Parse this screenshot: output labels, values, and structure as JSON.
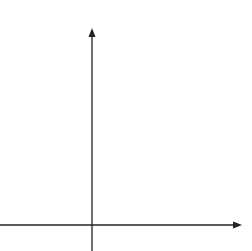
{
  "axes": {
    "x_label": "x",
    "y_label": "y",
    "x_ticks": [
      "−3",
      "−2",
      "−1",
      "0",
      "1",
      "2",
      "3",
      "4",
      "5",
      "6"
    ],
    "y_ticks": [
      "1",
      "2",
      "3",
      "4",
      "5",
      "6",
      "7",
      "8",
      "9"
    ],
    "x_range": [
      -4,
      7
    ],
    "y_range": [
      -1,
      9.7
    ]
  },
  "shape": {
    "label": "A",
    "vertices": [
      [
        4,
        1
      ],
      [
        5,
        1
      ],
      [
        6,
        3
      ],
      [
        4,
        3
      ]
    ],
    "stroke_color": "#666666"
  },
  "colors": {
    "grid": "#c8c8c8",
    "axis": "#222222"
  }
}
